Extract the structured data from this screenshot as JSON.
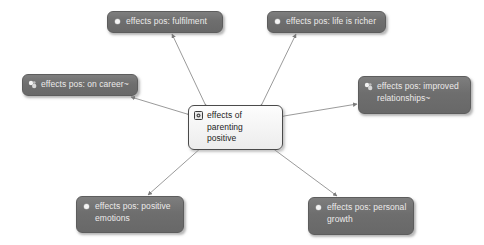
{
  "diagram": {
    "type": "concept-map",
    "title": "effects of parenting positive",
    "background_color": "#ffffff",
    "node_fill_color": "#6e6e6e",
    "node_text_color": "#eceaea",
    "center_fill_color": "#f3f3f3",
    "center_text_color": "#1d1d1d",
    "edge_color": "#8f8f8f",
    "edge_style": "double-headed-arrow"
  },
  "center_node": {
    "id": "center",
    "label": "effects of parenting\npositive",
    "icon": "node-case-icon",
    "x": 188,
    "y": 105,
    "width": 95,
    "height": 33
  },
  "nodes": [
    {
      "id": "fulfilment",
      "label": "effects pos: fulfilment",
      "icon": "node-dot-icon",
      "x": 107,
      "y": 11,
      "width": 116,
      "height": 22
    },
    {
      "id": "life-is-richer",
      "label": "effects pos: life is richer",
      "icon": "node-dot-icon",
      "x": 267,
      "y": 11,
      "width": 119,
      "height": 22
    },
    {
      "id": "on-career",
      "label": "effects pos: on career~",
      "icon": "node-aggregate-icon",
      "x": 22,
      "y": 74,
      "width": 116,
      "height": 22
    },
    {
      "id": "improved-relationships",
      "label": "effects pos: improved\nrelationships~",
      "icon": "node-aggregate-icon",
      "x": 358,
      "y": 76,
      "width": 113,
      "height": 38
    },
    {
      "id": "positive-emotions",
      "label": "effects pos: positive\nemotions",
      "icon": "node-dot-icon",
      "x": 76,
      "y": 196,
      "width": 108,
      "height": 37
    },
    {
      "id": "personal-growth",
      "label": "effects pos: personal\ngrowth",
      "icon": "node-dot-icon",
      "x": 308,
      "y": 197,
      "width": 106,
      "height": 38
    }
  ],
  "edges": [
    {
      "id": "edge-center-fulfilment",
      "from": "center",
      "to": "fulfilment",
      "x1": 205,
      "y1": 104,
      "x2": 172,
      "y2": 34
    },
    {
      "id": "edge-center-life-is-richer",
      "from": "center",
      "to": "life-is-richer",
      "x1": 262,
      "y1": 104,
      "x2": 296,
      "y2": 34
    },
    {
      "id": "edge-center-on-career",
      "from": "center",
      "to": "on-career",
      "x1": 187,
      "y1": 114,
      "x2": 131,
      "y2": 97
    },
    {
      "id": "edge-center-improved-relationships",
      "from": "center",
      "to": "improved-relationships",
      "x1": 284,
      "y1": 116,
      "x2": 357,
      "y2": 104
    },
    {
      "id": "edge-center-positive-emotions",
      "from": "center",
      "to": "positive-emotions",
      "x1": 211,
      "y1": 139,
      "x2": 148,
      "y2": 195
    },
    {
      "id": "edge-center-personal-growth",
      "from": "center",
      "to": "personal-growth",
      "x1": 260,
      "y1": 139,
      "x2": 337,
      "y2": 196
    }
  ]
}
